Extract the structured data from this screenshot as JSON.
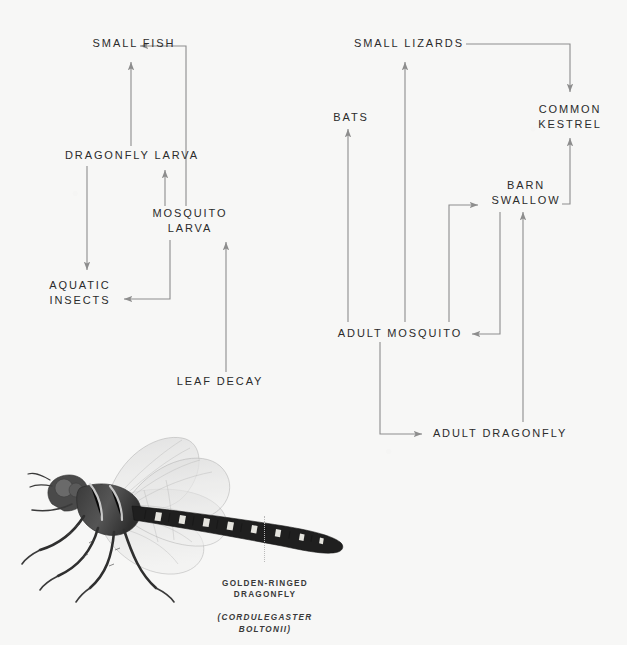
{
  "meta": {
    "background_color": "#f7f7f6",
    "text_color": "#2b2b2b",
    "arrow_color": "#8d8d8d"
  },
  "nodes": [
    {
      "id": "small-fish",
      "label": "SMALL FISH",
      "x": 86,
      "y": 36,
      "w": 96,
      "align": "center"
    },
    {
      "id": "dragonfly-larva",
      "label": "DRAGONFLY LARVA",
      "x": 56,
      "y": 148,
      "w": 152,
      "align": "center"
    },
    {
      "id": "mosquito-larva",
      "label": "MOSQUITO\nLARVA",
      "x": 150,
      "y": 206,
      "w": 80,
      "align": "center"
    },
    {
      "id": "aquatic-insects",
      "label": "AQUATIC\nINSECTS",
      "x": 40,
      "y": 278,
      "w": 80,
      "align": "center"
    },
    {
      "id": "leaf-decay",
      "label": "LEAF DECAY",
      "x": 168,
      "y": 374,
      "w": 104,
      "align": "center"
    },
    {
      "id": "small-lizards",
      "label": "SMALL LIZARDS",
      "x": 347,
      "y": 36,
      "w": 124,
      "align": "center"
    },
    {
      "id": "bats",
      "label": "BATS",
      "x": 330,
      "y": 110,
      "w": 42,
      "align": "center"
    },
    {
      "id": "common-kestrel",
      "label": "COMMON\nKESTREL",
      "x": 530,
      "y": 102,
      "w": 80,
      "align": "center"
    },
    {
      "id": "barn-swallow",
      "label": "BARN\nSWALLOW",
      "x": 487,
      "y": 178,
      "w": 78,
      "align": "center"
    },
    {
      "id": "adult-mosquito",
      "label": "ADULT MOSQUITO",
      "x": 333,
      "y": 326,
      "w": 134,
      "align": "center"
    },
    {
      "id": "adult-dragonfly",
      "label": "ADULT DRAGONFLY",
      "x": 430,
      "y": 426,
      "w": 140,
      "align": "center"
    }
  ],
  "links": [
    {
      "id": "mosquito-larva-to-dragonfly-larva",
      "from": "mosquito-larva",
      "to": "dragonfly-larva",
      "d": "M 165 206 L 165 170",
      "arrow": "up"
    },
    {
      "id": "mosquito-larva-to-small-fish",
      "from": "mosquito-larva",
      "to": "small-fish",
      "d": "M 186 206 L 186 46 L 140 46",
      "arrow": "left"
    },
    {
      "id": "dragonfly-larva-to-small-fish",
      "from": "dragonfly-larva",
      "to": "small-fish",
      "d": "M 131 146 L 131 62",
      "arrow": "up"
    },
    {
      "id": "dragonfly-larva-to-aquatic-insects",
      "from": "dragonfly-larva",
      "to": "aquatic-insects",
      "d": "M 87 166 L 87 270",
      "arrow": "down"
    },
    {
      "id": "mosquito-larva-to-aquatic-insects",
      "from": "mosquito-larva",
      "to": "aquatic-insects",
      "d": "M 170 240 L 170 299 L 124 299",
      "arrow": "left"
    },
    {
      "id": "leaf-decay-to-mosquito-larva",
      "from": "leaf-decay",
      "to": "mosquito-larva",
      "d": "M 226 372 L 226 242",
      "arrow": "up"
    },
    {
      "id": "leaf-decay-to-adult-dragonfly-col",
      "from": "leaf-decay",
      "to": "mosquito-larva",
      "d": "",
      "arrow": "none"
    },
    {
      "id": "adult-mosquito-to-bats",
      "from": "adult-mosquito",
      "to": "bats",
      "d": "M 348 322 L 348 129",
      "arrow": "up"
    },
    {
      "id": "adult-mosquito-to-small-lizards",
      "from": "adult-mosquito",
      "to": "small-lizards",
      "d": "M 405 322 L 405 62",
      "arrow": "up"
    },
    {
      "id": "adult-mosquito-to-barn-swallow",
      "from": "adult-mosquito",
      "to": "barn-swallow",
      "d": "M 449 322 L 449 205 L 478 205",
      "arrow": "right"
    },
    {
      "id": "barn-swallow-to-adult-mosquito",
      "from": "barn-swallow",
      "to": "adult-mosquito",
      "d": "M 500 212 L 500 334 L 472 334",
      "arrow": "left"
    },
    {
      "id": "adult-dragonfly-to-barn-swallow",
      "from": "adult-dragonfly",
      "to": "barn-swallow",
      "d": "M 523 422 L 523 212",
      "arrow": "up"
    },
    {
      "id": "adult-mosquito-to-adult-dragonfly",
      "from": "adult-mosquito",
      "to": "adult-dragonfly",
      "d": "M 380 342 L 380 434 L 422 434",
      "arrow": "right"
    },
    {
      "id": "small-lizards-to-common-kestrel",
      "from": "small-lizards",
      "to": "common-kestrel",
      "d": "M 466 44 L 570 44 L 570 92",
      "arrow": "down"
    },
    {
      "id": "barn-swallow-to-common-kestrel",
      "from": "barn-swallow",
      "to": "common-kestrel",
      "d": "M 562 204 L 570 204 L 570 138",
      "arrow": "up"
    }
  ],
  "specimen": {
    "caption_lines": "GOLDEN-RINGED\nDRAGONFLY",
    "caption_scientific": "(CORDULEGASTER\nBOLTONII)",
    "common_name": "GOLDEN-RINGED DRAGONFLY",
    "scientific_name": "CORDULEGASTER BOLTONII",
    "image_alt": "golden-ringed-dragonfly-specimen-photograph"
  }
}
